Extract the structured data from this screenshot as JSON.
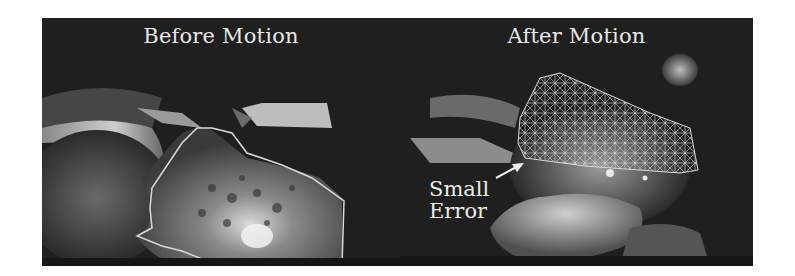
{
  "figure": {
    "panels": [
      {
        "title": "Before Motion"
      },
      {
        "title": "After Motion",
        "annotation": {
          "line1": "Small",
          "line2": "Error"
        }
      }
    ]
  },
  "colors": {
    "background": "#1e1e1e",
    "overlay": "#d8d8d8",
    "text": "#e8e8e8"
  }
}
